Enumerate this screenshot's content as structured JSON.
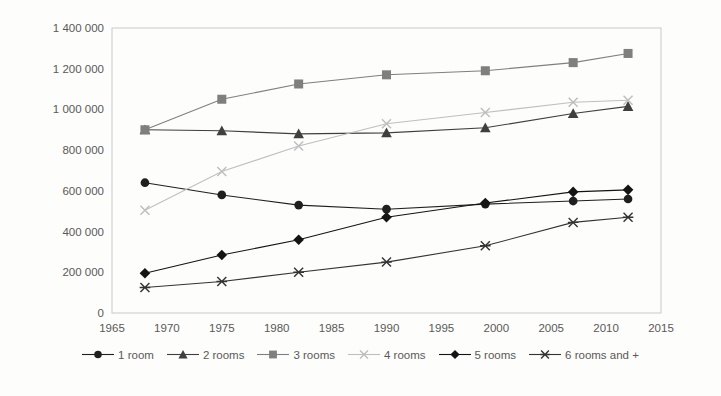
{
  "chart_data": {
    "type": "line",
    "title": "",
    "xlabel": "",
    "ylabel": "",
    "xlim": [
      1965,
      2015
    ],
    "ylim": [
      0,
      1400000
    ],
    "grid": "off",
    "legend_position": "bottom",
    "x_tick_values": [
      1965,
      1970,
      1975,
      1980,
      1985,
      1990,
      1995,
      2000,
      2005,
      2010,
      2015
    ],
    "x_tick_labels": [
      "1965",
      "1970",
      "1975",
      "1980",
      "1985",
      "1990",
      "1995",
      "2000",
      "2005",
      "2010",
      "2015"
    ],
    "y_tick_values": [
      0,
      200000,
      400000,
      600000,
      800000,
      1000000,
      1200000,
      1400000
    ],
    "y_tick_labels": [
      "0",
      "200 000",
      "400 000",
      "600 000",
      "800 000",
      "1 000 000",
      "1 200 000",
      "1 400 000"
    ],
    "x": [
      1968,
      1975,
      1982,
      1990,
      1999,
      2007,
      2012
    ],
    "series": [
      {
        "name": "1 room",
        "marker": "circle",
        "color": "#1f1f1f",
        "values": [
          640000,
          580000,
          530000,
          510000,
          535000,
          550000,
          560000
        ]
      },
      {
        "name": "2 rooms",
        "marker": "triangle",
        "color": "#3f3f3f",
        "values": [
          900000,
          895000,
          880000,
          885000,
          910000,
          980000,
          1015000
        ]
      },
      {
        "name": "3 rooms",
        "marker": "square",
        "color": "#7f7f7f",
        "values": [
          900000,
          1050000,
          1125000,
          1170000,
          1190000,
          1230000,
          1275000
        ]
      },
      {
        "name": "4 rooms",
        "marker": "x",
        "color": "#bfbfbf",
        "values": [
          505000,
          695000,
          820000,
          930000,
          985000,
          1035000,
          1045000
        ]
      },
      {
        "name": "5 rooms",
        "marker": "diamond",
        "color": "#141414",
        "values": [
          195000,
          285000,
          360000,
          470000,
          540000,
          595000,
          605000
        ]
      },
      {
        "name": "6 rooms and +",
        "marker": "asterisk",
        "color": "#333333",
        "values": [
          125000,
          155000,
          200000,
          250000,
          330000,
          445000,
          470000
        ]
      }
    ]
  },
  "style": {
    "text_color": "#595959",
    "axis_color": "#c9c9c9",
    "background": "#fdfdfb"
  }
}
